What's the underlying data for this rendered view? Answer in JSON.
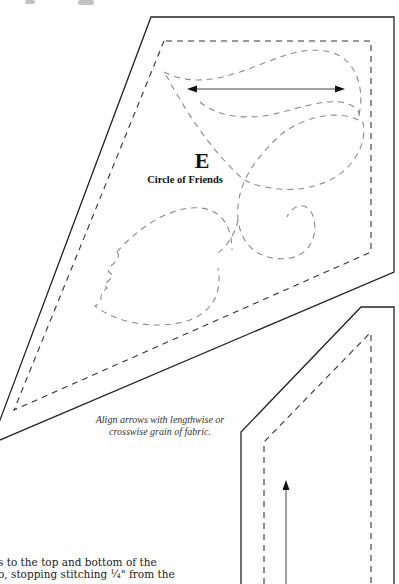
{
  "document": {
    "type": "quilt pattern template page",
    "pieces": [
      {
        "id": "piece-e",
        "letter": "E",
        "name": "Circle of Friends",
        "has_grain_arrow": true,
        "grain_arrow_direction": "horizontal-double"
      },
      {
        "id": "piece-border-strip",
        "has_grain_arrow": true,
        "grain_arrow_direction": "vertical-up"
      }
    ],
    "grain_note": {
      "line1": "Align arrows with lengthwise or",
      "line2": "crosswise grain of fabric."
    },
    "body_text": {
      "line1": "s to the top and bottom of the",
      "line2": "o, stopping stitching ¼\" from the"
    }
  },
  "colors": {
    "cut_line": "#222222",
    "seam_line": "#333333",
    "quilt_line": "#888888",
    "background": "#ffffff"
  }
}
